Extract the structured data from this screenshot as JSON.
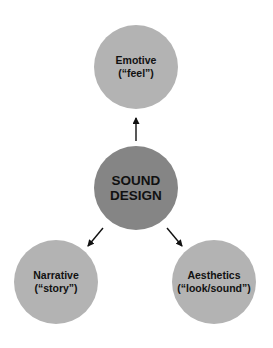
{
  "diagram": {
    "center": {
      "line1": "SOUND",
      "line2": "DESIGN",
      "color": "#858585"
    },
    "nodes": [
      {
        "id": "emotive",
        "line1": "Emotive",
        "line2": "(“feel”)",
        "color": "#b3b3b3"
      },
      {
        "id": "narrative",
        "line1": "Narrative",
        "line2": "(“story”)",
        "color": "#b3b3b3"
      },
      {
        "id": "aesthetics",
        "line1": "Aesthetics",
        "line2": "(“look/sound”)",
        "color": "#b3b3b3"
      }
    ],
    "edges": [
      {
        "from": "center",
        "to": "emotive"
      },
      {
        "from": "center",
        "to": "narrative"
      },
      {
        "from": "center",
        "to": "aesthetics"
      }
    ]
  }
}
